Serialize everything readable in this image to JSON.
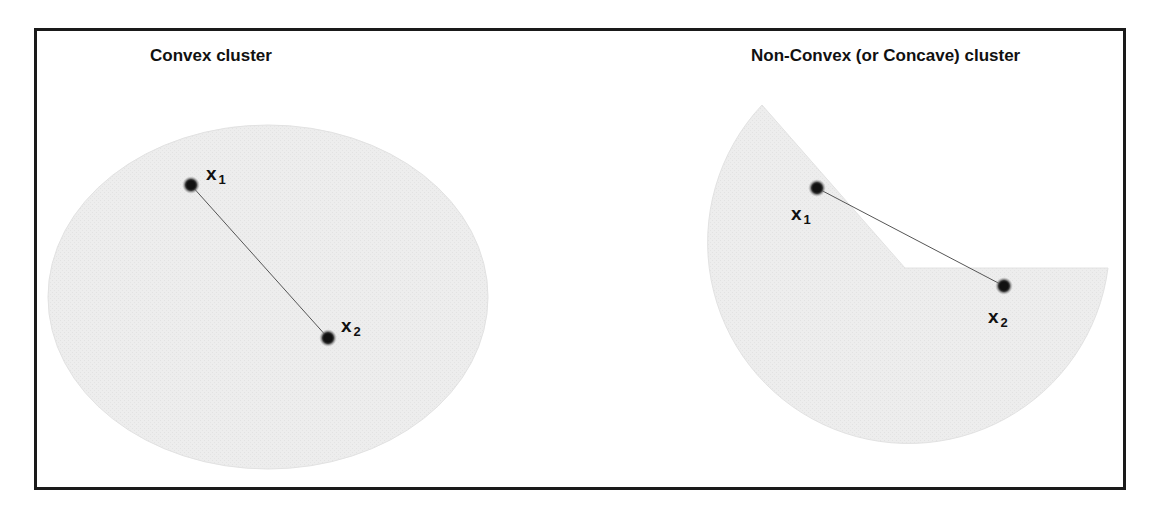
{
  "diagram": {
    "frame": {
      "border_color": "#1a1a1a"
    },
    "shape_fill": "#ececec",
    "point_color": "#111111",
    "line_color": "#555555",
    "panels": [
      {
        "id": "convex",
        "title": "Convex cluster",
        "shape": "ellipse",
        "points": [
          {
            "label": "x",
            "subscript": "1",
            "cx": 191,
            "cy": 185
          },
          {
            "label": "x",
            "subscript": "2",
            "cx": 328,
            "cy": 338
          }
        ]
      },
      {
        "id": "non-convex",
        "title": "Non-Convex (or Concave) cluster",
        "shape": "notched-circle",
        "points": [
          {
            "label": "x",
            "subscript": "1",
            "cx": 817,
            "cy": 188
          },
          {
            "label": "x",
            "subscript": "2",
            "cx": 1004,
            "cy": 286
          }
        ]
      }
    ]
  }
}
